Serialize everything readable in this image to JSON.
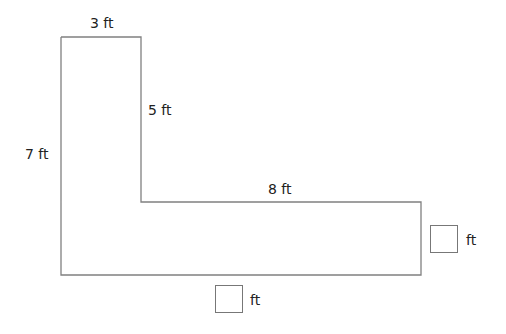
{
  "diagram": {
    "type": "L-shaped figure",
    "stroke_color": "#808080",
    "labels": {
      "top": "3 ft",
      "inner_vertical": "5 ft",
      "left": "7 ft",
      "inner_horizontal": "8 ft"
    },
    "unknowns": {
      "right_unit": "ft",
      "bottom_unit": "ft"
    }
  }
}
